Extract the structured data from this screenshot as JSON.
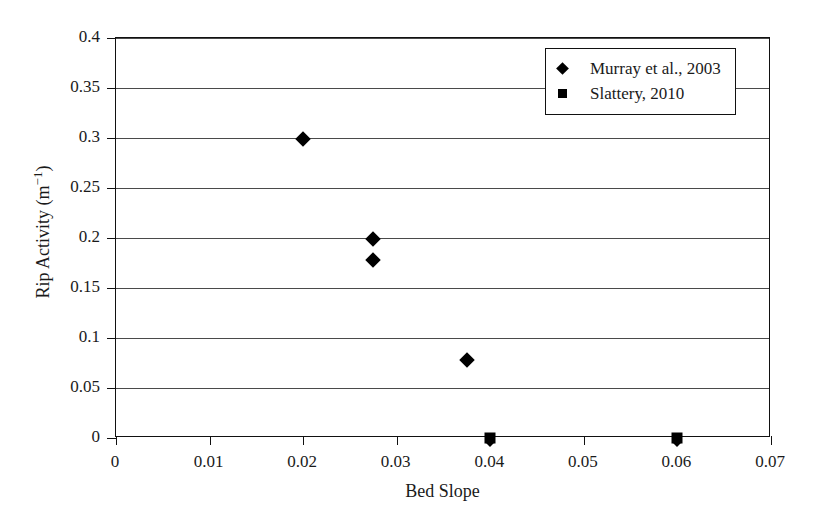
{
  "chart_data": {
    "type": "scatter",
    "title": "",
    "xlabel": "Bed Slope",
    "ylabel": "Rip Activity (m⁻¹)",
    "ylabel_base": "Rip Activity (m",
    "ylabel_exponent": "−1",
    "ylabel_close": ")",
    "xlim": [
      0,
      0.07
    ],
    "ylim": [
      0,
      0.4
    ],
    "grid": "horizontal",
    "legend_position": "top-right",
    "xticks": [
      0,
      0.01,
      0.02,
      0.03,
      0.04,
      0.05,
      0.06,
      0.07
    ],
    "xtick_labels": [
      "0",
      "0.01",
      "0.02",
      "0.03",
      "0.04",
      "0.05",
      "0.06",
      "0.07"
    ],
    "yticks": [
      0,
      0.05,
      0.1,
      0.15,
      0.2,
      0.25,
      0.3,
      0.35,
      0.4
    ],
    "ytick_labels": [
      "0",
      "0.05",
      "0.1",
      "0.15",
      "0.2",
      "0.25",
      "0.3",
      "0.35",
      "0.4"
    ],
    "series": [
      {
        "name": "Murray et al., 2003",
        "marker": "diamond",
        "color": "#000000",
        "points": [
          {
            "x": 0.02,
            "y": 0.299
          },
          {
            "x": 0.0275,
            "y": 0.199
          },
          {
            "x": 0.0275,
            "y": 0.178
          },
          {
            "x": 0.0375,
            "y": 0.078
          },
          {
            "x": 0.04,
            "y": -0.004
          },
          {
            "x": 0.06,
            "y": -0.004
          }
        ]
      },
      {
        "name": "Slattery, 2010",
        "marker": "square",
        "color": "#000000",
        "points": [
          {
            "x": 0.04,
            "y": 0.0
          },
          {
            "x": 0.06,
            "y": 0.0
          }
        ]
      }
    ]
  },
  "legend": {
    "entries": [
      {
        "label": "Murray et al., 2003",
        "marker": "diamond"
      },
      {
        "label": "Slattery, 2010",
        "marker": "square"
      }
    ]
  },
  "axes": {
    "x_title": "Bed Slope",
    "y_title": "Rip Activity (m⁻¹)"
  }
}
